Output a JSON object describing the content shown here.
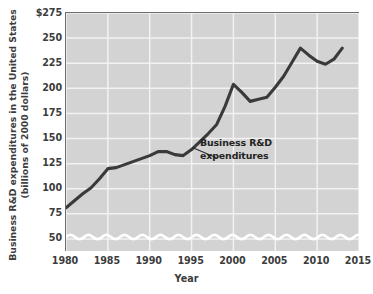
{
  "chart_data": {
    "type": "line",
    "title": "",
    "xlabel": "Year",
    "ylabel": "Business R&D expenditures in the United States (billions of 2000 dollars)",
    "ylabel_line1": "Business R&D expenditures in the United States",
    "ylabel_line2": "(billions of 2000 dollars)",
    "xlim": [
      1980,
      2015
    ],
    "ylim": [
      38,
      275
    ],
    "y_axis_break": true,
    "grid": true,
    "legend": "none",
    "x_ticks": [
      {
        "value": 1980,
        "label": "1980"
      },
      {
        "value": 1985,
        "label": "1985"
      },
      {
        "value": 1990,
        "label": "1990"
      },
      {
        "value": 1995,
        "label": "1995"
      },
      {
        "value": 2000,
        "label": "2000"
      },
      {
        "value": 2005,
        "label": "2005"
      },
      {
        "value": 2010,
        "label": "2010"
      },
      {
        "value": 2015,
        "label": "2015"
      }
    ],
    "y_ticks": [
      {
        "value": 275,
        "label": "$275"
      },
      {
        "value": 250,
        "label": "250"
      },
      {
        "value": 225,
        "label": "225"
      },
      {
        "value": 200,
        "label": "200"
      },
      {
        "value": 175,
        "label": "175"
      },
      {
        "value": 150,
        "label": "150"
      },
      {
        "value": 125,
        "label": "125"
      },
      {
        "value": 100,
        "label": "100"
      },
      {
        "value": 75,
        "label": "75"
      },
      {
        "value": 50,
        "label": "50"
      }
    ],
    "series": [
      {
        "name": "Business R&D expenditures",
        "annotation_line1": "Business R&D",
        "annotation_line2": "expenditures",
        "color": "#3a3a3a",
        "x": [
          1980,
          1981,
          1982,
          1983,
          1984,
          1985,
          1986,
          1987,
          1988,
          1989,
          1990,
          1991,
          1992,
          1993,
          1994,
          1995,
          1996,
          1997,
          1998,
          1999,
          2000,
          2001,
          2002,
          2003,
          2004,
          2005,
          2006,
          2007,
          2008,
          2009,
          2010,
          2011,
          2012,
          2013
        ],
        "values": [
          81,
          88,
          95,
          101,
          110,
          120,
          121,
          124,
          127,
          130,
          133,
          137,
          137,
          134,
          133,
          139,
          147,
          155,
          164,
          182,
          204,
          196,
          187,
          189,
          191,
          201,
          212,
          226,
          240,
          233,
          227,
          224,
          229,
          240
        ]
      }
    ],
    "colors": {
      "plot_background": "#d3d3d3",
      "gridline": "#f2f2f2",
      "axis": "#6e6e6e",
      "line": "#3a3a3a",
      "text": "#3c3c3c",
      "page_background": "#ffffff"
    }
  }
}
